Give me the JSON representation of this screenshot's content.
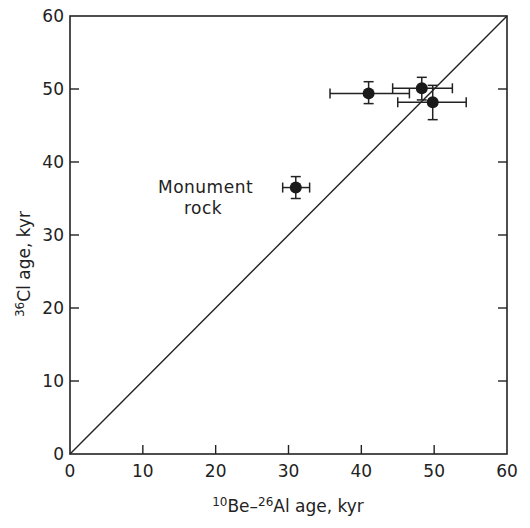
{
  "chart_data": {
    "type": "scatter",
    "title": "",
    "xlabel": "10Be-26Al age, kyr",
    "xlabel_parts": {
      "sup1": "10",
      "t1": "Be–",
      "sup2": "26",
      "t2": "Al age, kyr"
    },
    "ylabel": "36Cl age, kyr",
    "ylabel_parts": {
      "sup": "36",
      "t": "Cl  age, kyr"
    },
    "xlim": [
      0,
      60
    ],
    "ylim": [
      0,
      60
    ],
    "xticks": [
      0,
      10,
      20,
      30,
      40,
      50,
      60
    ],
    "yticks": [
      0,
      10,
      20,
      30,
      40,
      50,
      60
    ],
    "grid": false,
    "reference_line": {
      "label": "1:1 line",
      "from": [
        0,
        0
      ],
      "to": [
        60,
        60
      ]
    },
    "series": [
      {
        "name": "samples",
        "points": [
          {
            "x": 31.0,
            "y": 36.5,
            "xerr": [
              29.2,
              32.9
            ],
            "yerr": [
              35.0,
              38.0
            ],
            "label": "Monument rock"
          },
          {
            "x": 41.0,
            "y": 49.4,
            "xerr": [
              35.7,
              46.6
            ],
            "yerr": [
              48.0,
              51.0
            ]
          },
          {
            "x": 48.3,
            "y": 50.1,
            "xerr": [
              44.3,
              52.5
            ],
            "yerr": [
              48.5,
              51.6
            ]
          },
          {
            "x": 49.8,
            "y": 48.2,
            "xerr": [
              45.0,
              54.4
            ],
            "yerr": [
              45.8,
              50.5
            ]
          }
        ]
      }
    ],
    "annotations": [
      {
        "text_line1": "Monument",
        "text_line2": "rock",
        "near_point": 0
      }
    ]
  }
}
